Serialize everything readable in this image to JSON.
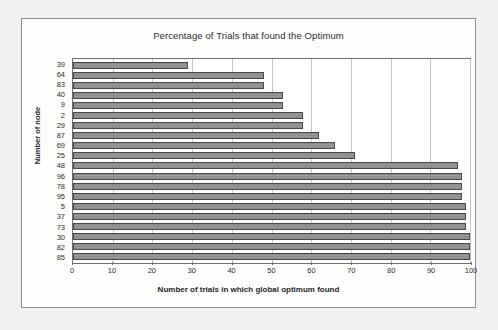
{
  "chart_data": {
    "type": "bar",
    "orientation": "horizontal",
    "title": "Percentage of Trials that found the Optimum",
    "xlabel": "Number of trials in which global optimum found",
    "ylabel": "Number of node",
    "xlim": [
      0,
      100
    ],
    "xticks": [
      0,
      10,
      20,
      30,
      40,
      50,
      60,
      70,
      80,
      90,
      100
    ],
    "grid": "vertical",
    "legend": "none",
    "categories": [
      "39",
      "64",
      "83",
      "40",
      "9",
      "2",
      "29",
      "87",
      "69",
      "25",
      "48",
      "96",
      "78",
      "95",
      "5",
      "37",
      "73",
      "30",
      "82",
      "85"
    ],
    "values": [
      29,
      48,
      48,
      53,
      53,
      58,
      58,
      62,
      66,
      71,
      97,
      98,
      98,
      98,
      99,
      99,
      99,
      100,
      100,
      100
    ],
    "bar_color": "#8f8f8f",
    "bar_border_color": "#4a4a4a",
    "plot_background": "#ffffff",
    "gridline_color": "#c6c6c6"
  }
}
